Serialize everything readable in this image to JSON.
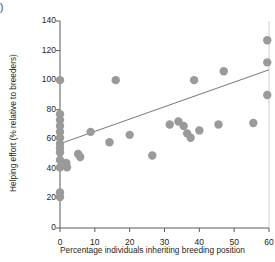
{
  "panel": {
    "label": ")"
  },
  "chart_data": {
    "type": "scatter",
    "title": "",
    "xlabel": "Percentage individuals inheriting breeding position",
    "ylabel": "Helping effort (% relative to breeders)",
    "xlim": [
      0,
      60
    ],
    "ylim": [
      0,
      140
    ],
    "xticks": [
      0,
      10,
      20,
      30,
      40,
      50,
      60
    ],
    "yticks": [
      0,
      20,
      40,
      60,
      80,
      100,
      120,
      140
    ],
    "xtick_labels": [
      "0",
      "10",
      "20",
      "30",
      "40",
      "50",
      "60"
    ],
    "ytick_labels": [
      "0",
      "20",
      "40",
      "60",
      "80",
      "100",
      "120",
      "140"
    ],
    "grid": false,
    "legend": "none",
    "marker": {
      "shape": "circle",
      "color": "#9a9a9a",
      "size": 4.2
    },
    "points": [
      {
        "x": 0.0,
        "y": 100
      },
      {
        "x": 0.0,
        "y": 77
      },
      {
        "x": 0.0,
        "y": 73
      },
      {
        "x": 0.0,
        "y": 69
      },
      {
        "x": 0.0,
        "y": 65
      },
      {
        "x": 0.0,
        "y": 61
      },
      {
        "x": 0.0,
        "y": 57
      },
      {
        "x": 0.0,
        "y": 54
      },
      {
        "x": 0.0,
        "y": 51
      },
      {
        "x": 0.0,
        "y": 46
      },
      {
        "x": 0.0,
        "y": 41
      },
      {
        "x": 0.0,
        "y": 24
      },
      {
        "x": 0.0,
        "y": 21
      },
      {
        "x": 1.8,
        "y": 44
      },
      {
        "x": 2.0,
        "y": 41
      },
      {
        "x": 5.2,
        "y": 50
      },
      {
        "x": 5.8,
        "y": 48
      },
      {
        "x": 8.8,
        "y": 65
      },
      {
        "x": 14.2,
        "y": 58
      },
      {
        "x": 16.0,
        "y": 100
      },
      {
        "x": 20.0,
        "y": 63
      },
      {
        "x": 26.5,
        "y": 49
      },
      {
        "x": 31.5,
        "y": 70
      },
      {
        "x": 34.0,
        "y": 72
      },
      {
        "x": 35.5,
        "y": 69
      },
      {
        "x": 36.5,
        "y": 64
      },
      {
        "x": 37.5,
        "y": 61
      },
      {
        "x": 38.5,
        "y": 100
      },
      {
        "x": 40.0,
        "y": 66
      },
      {
        "x": 45.5,
        "y": 70
      },
      {
        "x": 47.0,
        "y": 106
      },
      {
        "x": 55.5,
        "y": 71
      },
      {
        "x": 59.5,
        "y": 127
      },
      {
        "x": 59.5,
        "y": 112
      },
      {
        "x": 59.5,
        "y": 90
      }
    ],
    "trendline": {
      "type": "linear",
      "x_start": 0,
      "y_start": 57,
      "x_end": 60,
      "y_end": 107,
      "color": "#777777"
    }
  }
}
